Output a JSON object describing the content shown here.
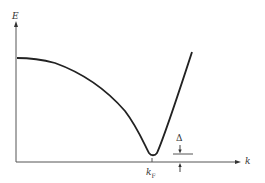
{
  "diagram": {
    "type": "energy-dispersion",
    "axes": {
      "y_label": "E",
      "x_label": "k"
    },
    "annotations": {
      "fermi_wavevector": {
        "symbol": "k",
        "subscript": "F"
      },
      "gap": "Δ"
    },
    "colors": {
      "curve": "#222222",
      "axis": "#555555",
      "background": "#ffffff"
    },
    "curve_points": [
      [
        17,
        58
      ],
      [
        35,
        59
      ],
      [
        60,
        66
      ],
      [
        85,
        79
      ],
      [
        110,
        96
      ],
      [
        130,
        117
      ],
      [
        145,
        142
      ],
      [
        152,
        155
      ],
      [
        158,
        152
      ],
      [
        170,
        118
      ],
      [
        182,
        82
      ],
      [
        192,
        52
      ]
    ]
  }
}
